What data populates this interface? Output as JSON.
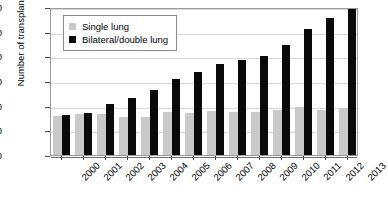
{
  "chart_data": {
    "type": "bar",
    "title": "",
    "xlabel": "",
    "ylabel": "Number of transplants",
    "ylim": [
      0,
      3000
    ],
    "yticks": [
      0,
      500,
      1000,
      1500,
      2000,
      2500,
      3000
    ],
    "grid": "horizontal",
    "legend_position": "upper-left-inside",
    "categories": [
      "2000",
      "2001",
      "2002",
      "2003",
      "2004",
      "2005",
      "2006",
      "2007",
      "2008",
      "2009",
      "2010",
      "2011",
      "2012",
      "2013"
    ],
    "series": [
      {
        "name": "Single lung",
        "color": "#c9c9c9",
        "values": [
          800,
          840,
          830,
          770,
          780,
          880,
          860,
          900,
          880,
          880,
          910,
          980,
          910,
          960
        ]
      },
      {
        "name": "Bilateral/double lung",
        "color": "#0a0a0a",
        "values": [
          810,
          850,
          1040,
          1160,
          1320,
          1550,
          1680,
          1850,
          1930,
          2000,
          2230,
          2550,
          2770,
          2950
        ]
      }
    ]
  },
  "legend": {
    "items": [
      {
        "label": "Single lung",
        "swatch": "single"
      },
      {
        "label": "Bilateral/double lung",
        "swatch": "bilateral"
      }
    ]
  }
}
